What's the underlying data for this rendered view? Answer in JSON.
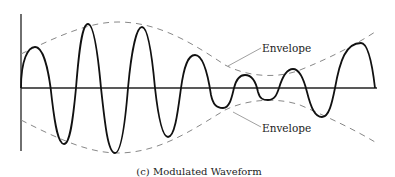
{
  "figure": {
    "caption": "(c) Modulated Waveform",
    "labels": {
      "upper_envelope": "Envelope",
      "lower_envelope": "Envelope"
    }
  },
  "colors": {
    "waveform": "#111111",
    "envelope": "#888888",
    "axis": "#222222",
    "text": "#222222"
  }
}
